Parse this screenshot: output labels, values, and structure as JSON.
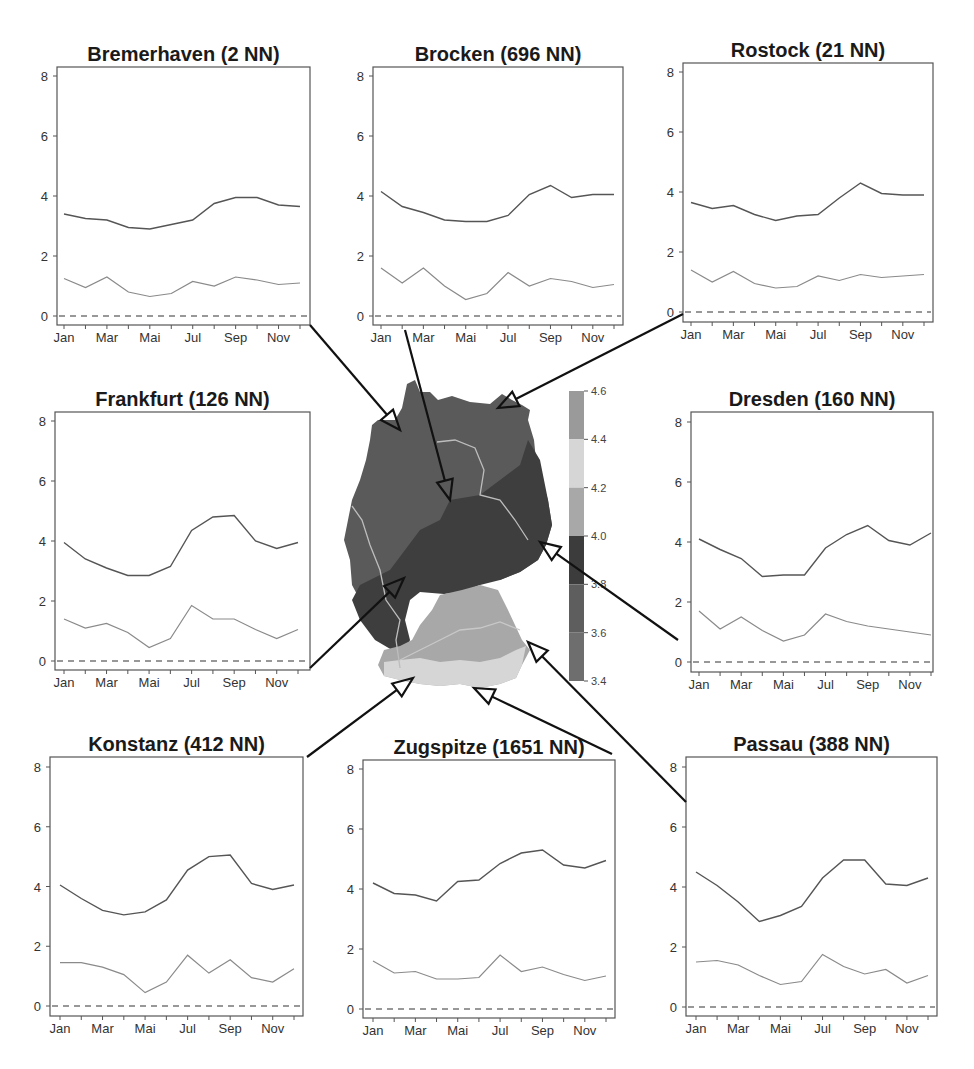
{
  "figure": {
    "months": [
      "Jan",
      "Feb",
      "Mar",
      "Apr",
      "Mai",
      "Jun",
      "Jul",
      "Aug",
      "Sep",
      "Okt",
      "Nov",
      "Dez"
    ],
    "month_tick_labels": [
      "Jan",
      "",
      "Mar",
      "",
      "Mai",
      "",
      "Jul",
      "",
      "Sep",
      "",
      "Nov",
      ""
    ],
    "y_ticks": [
      0,
      2,
      4,
      6,
      8
    ],
    "colorbar": {
      "ticks": [
        "4.6",
        "4.4",
        "4.2",
        "4.0",
        "3.8",
        "3.6",
        "3.4"
      ],
      "bands": [
        {
          "from": 4.4,
          "to": 4.6,
          "color": "#9a9a9a"
        },
        {
          "from": 4.2,
          "to": 4.4,
          "color": "#d6d6d6"
        },
        {
          "from": 4.0,
          "to": 4.2,
          "color": "#a8a8a8"
        },
        {
          "from": 3.8,
          "to": 4.0,
          "color": "#3c3c3c"
        },
        {
          "from": 3.6,
          "to": 3.8,
          "color": "#5e5e5e"
        },
        {
          "from": 3.4,
          "to": 3.6,
          "color": "#6e6e6e"
        }
      ]
    },
    "colors": {
      "upper_line": "#555555",
      "lower_line": "#8a8a8a",
      "zero_line": "#333333",
      "axis": "#555555",
      "arrow": "#111111"
    }
  },
  "chart_data": [
    {
      "type": "line",
      "title": "Bremerhaven (2 NN)",
      "xlabel": "",
      "ylabel": "",
      "ylim": [
        0,
        8
      ],
      "x": [
        "Jan",
        "Feb",
        "Mar",
        "Apr",
        "Mai",
        "Jun",
        "Jul",
        "Aug",
        "Sep",
        "Okt",
        "Nov",
        "Dez"
      ],
      "series": [
        {
          "name": "upper",
          "values": [
            3.4,
            3.25,
            3.2,
            2.95,
            2.9,
            3.05,
            3.2,
            3.75,
            3.95,
            3.95,
            3.7,
            3.65
          ]
        },
        {
          "name": "lower",
          "values": [
            1.25,
            0.95,
            1.3,
            0.8,
            0.65,
            0.75,
            1.15,
            1.0,
            1.3,
            1.2,
            1.05,
            1.1
          ]
        },
        {
          "name": "zero",
          "values": [
            0,
            0,
            0,
            0,
            0,
            0,
            0,
            0,
            0,
            0,
            0,
            0
          ],
          "style": "dashed"
        }
      ]
    },
    {
      "type": "line",
      "title": "Brocken (696 NN)",
      "xlabel": "",
      "ylabel": "",
      "ylim": [
        0,
        8
      ],
      "x": [
        "Jan",
        "Feb",
        "Mar",
        "Apr",
        "Mai",
        "Jun",
        "Jul",
        "Aug",
        "Sep",
        "Okt",
        "Nov",
        "Dez"
      ],
      "series": [
        {
          "name": "upper",
          "values": [
            4.15,
            3.65,
            3.45,
            3.2,
            3.15,
            3.15,
            3.35,
            4.05,
            4.35,
            3.95,
            4.05,
            4.05
          ]
        },
        {
          "name": "lower",
          "values": [
            1.6,
            1.1,
            1.6,
            1.0,
            0.55,
            0.75,
            1.45,
            1.0,
            1.25,
            1.15,
            0.95,
            1.05
          ]
        },
        {
          "name": "zero",
          "values": [
            0,
            0,
            0,
            0,
            0,
            0,
            0,
            0,
            0,
            0,
            0,
            0
          ],
          "style": "dashed"
        }
      ]
    },
    {
      "type": "line",
      "title": "Rostock (21 NN)",
      "xlabel": "",
      "ylabel": "",
      "ylim": [
        0,
        8
      ],
      "x": [
        "Jan",
        "Feb",
        "Mar",
        "Apr",
        "Mai",
        "Jun",
        "Jul",
        "Aug",
        "Sep",
        "Okt",
        "Nov",
        "Dez"
      ],
      "series": [
        {
          "name": "upper",
          "values": [
            3.65,
            3.45,
            3.55,
            3.25,
            3.05,
            3.2,
            3.25,
            3.8,
            4.3,
            3.95,
            3.9,
            3.9
          ]
        },
        {
          "name": "lower",
          "values": [
            1.4,
            1.0,
            1.35,
            0.95,
            0.8,
            0.85,
            1.2,
            1.05,
            1.25,
            1.15,
            1.2,
            1.25
          ]
        },
        {
          "name": "zero",
          "values": [
            0,
            0,
            0,
            0,
            0,
            0,
            0,
            0,
            0,
            0,
            0,
            0
          ],
          "style": "dashed"
        }
      ]
    },
    {
      "type": "line",
      "title": "Frankfurt (126 NN)",
      "xlabel": "",
      "ylabel": "",
      "ylim": [
        0,
        8
      ],
      "x": [
        "Jan",
        "Feb",
        "Mar",
        "Apr",
        "Mai",
        "Jun",
        "Jul",
        "Aug",
        "Sep",
        "Okt",
        "Nov",
        "Dez"
      ],
      "series": [
        {
          "name": "upper",
          "values": [
            3.95,
            3.4,
            3.1,
            2.85,
            2.85,
            3.15,
            4.35,
            4.8,
            4.85,
            4.0,
            3.75,
            3.95
          ]
        },
        {
          "name": "lower",
          "values": [
            1.4,
            1.1,
            1.25,
            0.95,
            0.45,
            0.75,
            1.85,
            1.4,
            1.4,
            1.05,
            0.75,
            1.05
          ]
        },
        {
          "name": "zero",
          "values": [
            0,
            0,
            0,
            0,
            0,
            0,
            0,
            0,
            0,
            0,
            0,
            0
          ],
          "style": "dashed"
        }
      ]
    },
    {
      "type": "line",
      "title": "Dresden (160 NN)",
      "xlabel": "",
      "ylabel": "",
      "ylim": [
        0,
        8
      ],
      "x": [
        "Jan",
        "Feb",
        "Mar",
        "Apr",
        "Mai",
        "Jun",
        "Jul",
        "Aug",
        "Sep",
        "Okt",
        "Nov",
        "Dez"
      ],
      "series": [
        {
          "name": "upper",
          "values": [
            4.1,
            3.75,
            3.45,
            2.85,
            2.9,
            2.9,
            3.8,
            4.25,
            4.55,
            4.05,
            3.9,
            4.3
          ]
        },
        {
          "name": "lower",
          "values": [
            1.7,
            1.1,
            1.5,
            1.05,
            0.7,
            0.9,
            1.6,
            1.35,
            1.2,
            1.1,
            1.0,
            0.9
          ]
        },
        {
          "name": "zero",
          "values": [
            0,
            0,
            0,
            0,
            0,
            0,
            0,
            0,
            0,
            0,
            0,
            0
          ],
          "style": "dashed"
        }
      ]
    },
    {
      "type": "line",
      "title": "Konstanz (412 NN)",
      "xlabel": "",
      "ylabel": "",
      "ylim": [
        0,
        8
      ],
      "x": [
        "Jan",
        "Feb",
        "Mar",
        "Apr",
        "Mai",
        "Jun",
        "Jul",
        "Aug",
        "Sep",
        "Okt",
        "Nov",
        "Dez"
      ],
      "series": [
        {
          "name": "upper",
          "values": [
            4.05,
            3.6,
            3.2,
            3.05,
            3.15,
            3.55,
            4.55,
            5.0,
            5.05,
            4.1,
            3.9,
            4.05
          ]
        },
        {
          "name": "lower",
          "values": [
            1.45,
            1.45,
            1.3,
            1.05,
            0.45,
            0.8,
            1.7,
            1.1,
            1.55,
            0.95,
            0.8,
            1.25
          ]
        },
        {
          "name": "zero",
          "values": [
            0,
            0,
            0,
            0,
            0,
            0,
            0,
            0,
            0,
            0,
            0,
            0
          ],
          "style": "dashed"
        }
      ]
    },
    {
      "type": "line",
      "title": "Zugspitze (1651 NN)",
      "xlabel": "",
      "ylabel": "",
      "ylim": [
        0,
        8
      ],
      "x": [
        "Jan",
        "Feb",
        "Mar",
        "Apr",
        "Mai",
        "Jun",
        "Jul",
        "Aug",
        "Sep",
        "Okt",
        "Nov",
        "Dez"
      ],
      "series": [
        {
          "name": "upper",
          "values": [
            4.2,
            3.85,
            3.8,
            3.6,
            4.25,
            4.3,
            4.85,
            5.2,
            5.3,
            4.8,
            4.7,
            4.95
          ]
        },
        {
          "name": "lower",
          "values": [
            1.6,
            1.2,
            1.25,
            1.0,
            1.0,
            1.05,
            1.8,
            1.25,
            1.4,
            1.15,
            0.95,
            1.1
          ]
        },
        {
          "name": "zero",
          "values": [
            0,
            0,
            0,
            0,
            0,
            0,
            0,
            0,
            0,
            0,
            0,
            0
          ],
          "style": "dashed"
        }
      ]
    },
    {
      "type": "line",
      "title": "Passau (388 NN)",
      "xlabel": "",
      "ylabel": "",
      "ylim": [
        0,
        8
      ],
      "x": [
        "Jan",
        "Feb",
        "Mar",
        "Apr",
        "Mai",
        "Jun",
        "Jul",
        "Aug",
        "Sep",
        "Okt",
        "Nov",
        "Dez"
      ],
      "series": [
        {
          "name": "upper",
          "values": [
            4.5,
            4.05,
            3.5,
            2.85,
            3.05,
            3.35,
            4.3,
            4.9,
            4.9,
            4.1,
            4.05,
            4.3
          ]
        },
        {
          "name": "lower",
          "values": [
            1.5,
            1.55,
            1.4,
            1.05,
            0.75,
            0.85,
            1.75,
            1.35,
            1.1,
            1.25,
            0.8,
            1.05
          ]
        },
        {
          "name": "zero",
          "values": [
            0,
            0,
            0,
            0,
            0,
            0,
            0,
            0,
            0,
            0,
            0,
            0
          ],
          "style": "dashed"
        }
      ]
    }
  ],
  "layout": {
    "panels": [
      {
        "left": 57,
        "right": 310,
        "top": 67,
        "bottom": 325,
        "y8": 76,
        "y0": 316,
        "xJan": 64,
        "xDez": 300
      },
      {
        "left": 373,
        "right": 623,
        "top": 67,
        "bottom": 325,
        "y8": 76,
        "y0": 316,
        "xJan": 381,
        "xDez": 614
      },
      {
        "left": 683,
        "right": 933,
        "top": 63,
        "bottom": 322,
        "y8": 72,
        "y0": 312,
        "xJan": 691,
        "xDez": 924
      },
      {
        "left": 55,
        "right": 310,
        "top": 412,
        "bottom": 670,
        "y8": 421,
        "y0": 661,
        "xJan": 64,
        "xDez": 298
      },
      {
        "left": 691,
        "right": 933,
        "top": 412,
        "bottom": 672,
        "y8": 422,
        "y0": 662,
        "xJan": 699,
        "xDez": 931
      },
      {
        "left": 50,
        "right": 303,
        "top": 757,
        "bottom": 1016,
        "y8": 767,
        "y0": 1006,
        "xJan": 60,
        "xDez": 294
      },
      {
        "left": 363,
        "right": 615,
        "top": 760,
        "bottom": 1018,
        "y8": 769,
        "y0": 1009,
        "xJan": 373,
        "xDez": 606
      },
      {
        "left": 686,
        "right": 937,
        "top": 757,
        "bottom": 1016,
        "y8": 767,
        "y0": 1007,
        "xJan": 696,
        "xDez": 928
      }
    ],
    "arrows": [
      {
        "from": [
          310,
          325
        ],
        "to": [
          400,
          430
        ]
      },
      {
        "from": [
          405,
          330
        ],
        "to": [
          450,
          500
        ]
      },
      {
        "from": [
          683,
          314
        ],
        "to": [
          498,
          408
        ]
      },
      {
        "from": [
          310,
          668
        ],
        "to": [
          404,
          578
        ]
      },
      {
        "from": [
          678,
          640
        ],
        "to": [
          540,
          542
        ]
      },
      {
        "from": [
          307,
          757
        ],
        "to": [
          413,
          678
        ]
      },
      {
        "from": [
          612,
          754
        ],
        "to": [
          474,
          688
        ]
      },
      {
        "from": [
          686,
          802
        ],
        "to": [
          528,
          642
        ]
      }
    ]
  }
}
